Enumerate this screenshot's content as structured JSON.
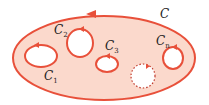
{
  "diagram": {
    "colors": {
      "region_fill": "#fbd9cc",
      "stroke": "#e8503a",
      "hole_fill": "#ffffff",
      "label": "#222222"
    },
    "outer_curve": {
      "label": "C"
    },
    "inner_curves": [
      {
        "label": "C",
        "sub": "1"
      },
      {
        "label": "C",
        "sub": "2"
      },
      {
        "label": "C",
        "sub": "3"
      },
      {
        "label": "C",
        "sub": "n"
      }
    ],
    "dotted_hole": {
      "style": "dotted"
    }
  }
}
